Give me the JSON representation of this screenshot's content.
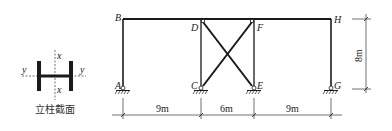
{
  "section": {
    "caption": "立柱截面",
    "axis_x_top": "x",
    "axis_x_bottom": "x",
    "axis_y_left": "y",
    "axis_y_right": "y"
  },
  "frame": {
    "nodes": {
      "A": "A",
      "B": "B",
      "C": "C",
      "D": "D",
      "E": "E",
      "F": "F",
      "G": "G",
      "H": "H"
    },
    "members": [
      {
        "from": "A",
        "to": "B",
        "type": "column"
      },
      {
        "from": "C",
        "to": "D",
        "type": "column"
      },
      {
        "from": "E",
        "to": "F",
        "type": "column"
      },
      {
        "from": "G",
        "to": "H",
        "type": "column"
      },
      {
        "from": "B",
        "to": "H",
        "type": "beam"
      },
      {
        "from": "C",
        "to": "F",
        "type": "brace"
      },
      {
        "from": "D",
        "to": "E",
        "type": "brace"
      }
    ],
    "supports": [
      "A",
      "C",
      "E",
      "G"
    ],
    "support_type": "pinned"
  },
  "dimensions": {
    "span_1": "9m",
    "span_2": "6m",
    "span_3": "9m",
    "height": "8m"
  },
  "colors": {
    "line": "#1a1a1a",
    "background": "#ffffff"
  }
}
